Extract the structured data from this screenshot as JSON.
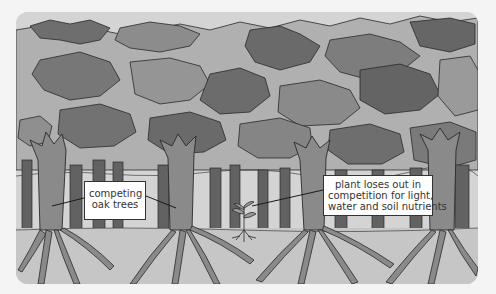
{
  "figure": {
    "colors": {
      "background": "#f4f4f4",
      "canopy_dark": "#6b6b6b",
      "canopy_mid": "#8e8e8e",
      "canopy_light": "#b4b4b4",
      "sky_gap": "#d4d4d4",
      "trunk_front": "#8a8a8a",
      "trunk_back": "#626262",
      "ground": "#c8c8c8",
      "outline": "#2a2a2a",
      "label_bg": "#ffffff",
      "label_text": "#333333"
    }
  },
  "labels": {
    "oak_trees": {
      "line1": "competing",
      "line2": "oak trees"
    },
    "plant": {
      "line1": "plant loses out in",
      "line2": "competition for light,",
      "line3": "water and soil nutrients"
    }
  }
}
